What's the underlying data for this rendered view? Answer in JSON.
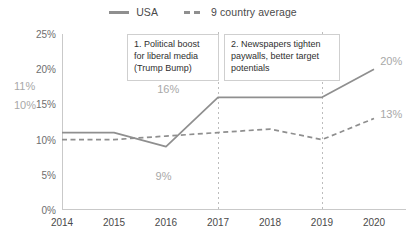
{
  "legend": {
    "items": [
      {
        "label": "USA",
        "style": "solid",
        "color": "#8f8f8f",
        "icon": "line-solid-icon"
      },
      {
        "label": "9 country average",
        "style": "dashed",
        "color": "#8f8f8f",
        "icon": "line-dashed-icon"
      }
    ]
  },
  "annotations": [
    {
      "id": 1,
      "text": "1. Political boost for liberal media (Trump Bump)"
    },
    {
      "id": 2,
      "text": "2. Newspapers tighten paywalls, better target potentials"
    }
  ],
  "data_labels": {
    "usa_start": "11%",
    "avg_start": "10%",
    "usa_2016": "9%",
    "usa_2017": "16%",
    "usa_2020": "20%",
    "avg_2020": "13%"
  },
  "chart_data": {
    "type": "line",
    "title": "",
    "xlabel": "",
    "ylabel": "",
    "categories": [
      "2014",
      "2015",
      "2016",
      "2017",
      "2018",
      "2019",
      "2020"
    ],
    "x": [
      2014,
      2015,
      2016,
      2017,
      2018,
      2019,
      2020
    ],
    "series": [
      {
        "name": "USA",
        "style": "solid",
        "color": "#8f8f8f",
        "values": [
          11,
          11,
          9,
          16,
          16,
          16,
          20
        ]
      },
      {
        "name": "9 country average",
        "style": "dashed",
        "color": "#8f8f8f",
        "values": [
          10,
          10,
          10.5,
          11,
          11.5,
          10,
          13
        ]
      }
    ],
    "ylim": [
      0,
      25
    ],
    "yticks": [
      0,
      5,
      10,
      15,
      20,
      25
    ],
    "ytick_labels": [
      "0%",
      "5%",
      "10%",
      "15%",
      "20%",
      "25%"
    ],
    "gridlines": {
      "horizontal": false,
      "vertical_dotted_at": [
        2017,
        2019
      ]
    },
    "legend_position": "top-center"
  }
}
